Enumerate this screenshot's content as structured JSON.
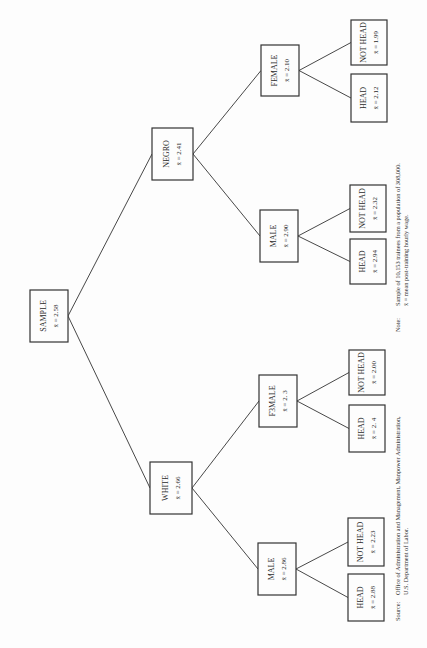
{
  "diagram": {
    "orientation": "rotated-90-ccw",
    "root": {
      "id": "sample",
      "label": "SAMPLE",
      "value": "x̄ = 2.58"
    },
    "nodes": [
      {
        "id": "sample",
        "label": "SAMPLE",
        "value": "x̄ = 2.58",
        "x": 30,
        "y": 290,
        "w": 38,
        "h": 52
      },
      {
        "id": "negro",
        "label": "NEGRO",
        "value": "x̄ = 2.41",
        "x": 152,
        "y": 128,
        "w": 41,
        "h": 52
      },
      {
        "id": "white",
        "label": "WHITE",
        "value": "x̄ = 2.66",
        "x": 150,
        "y": 462,
        "w": 42,
        "h": 52
      },
      {
        "id": "negro-female",
        "label": "FEMALE",
        "value": "x̄ = 2.10",
        "x": 261,
        "y": 45,
        "w": 38,
        "h": 51
      },
      {
        "id": "negro-male",
        "label": "MALE",
        "value": "x̄ = 2.90",
        "x": 260,
        "y": 210,
        "w": 38,
        "h": 52
      },
      {
        "id": "white-female",
        "label": "F3MALE",
        "value": "x̄ = 2. 3",
        "x": 259,
        "y": 375,
        "w": 38,
        "h": 52
      },
      {
        "id": "white-male",
        "label": "MALE",
        "value": "x̄ = 2.86",
        "x": 258,
        "y": 543,
        "w": 38,
        "h": 52
      },
      {
        "id": "nf-nothead",
        "label": "NOT HEAD",
        "value": "x̄ = 1.99",
        "x": 351,
        "y": 20,
        "w": 36,
        "h": 45
      },
      {
        "id": "nf-head",
        "label": "HEAD",
        "value": "x̄ = 2.12",
        "x": 351,
        "y": 74,
        "w": 36,
        "h": 48
      },
      {
        "id": "nm-nothead",
        "label": "NOT HEAD",
        "value": "x̄ = 2.32",
        "x": 350,
        "y": 185,
        "w": 36,
        "h": 47
      },
      {
        "id": "nm-head",
        "label": "HEAD",
        "value": "x̄ = 2.94",
        "x": 350,
        "y": 239,
        "w": 36,
        "h": 45
      },
      {
        "id": "wf-nothead",
        "label": "NOT HEAD",
        "value": "x̄ = 2.00",
        "x": 349,
        "y": 350,
        "w": 36,
        "h": 45
      },
      {
        "id": "wf-head",
        "label": "HEAD",
        "value": "x̄ = 2. 4",
        "x": 349,
        "y": 405,
        "w": 36,
        "h": 47
      },
      {
        "id": "wm-nothead",
        "label": "NOT HEAD",
        "value": "x̄ = 2.23",
        "x": 348,
        "y": 518,
        "w": 36,
        "h": 48
      },
      {
        "id": "wm-head",
        "label": "HEAD",
        "value": "x̄ = 2.88",
        "x": 348,
        "y": 574,
        "w": 36,
        "h": 47
      }
    ],
    "edges": [
      [
        "sample",
        "negro"
      ],
      [
        "sample",
        "white"
      ],
      [
        "negro",
        "negro-female"
      ],
      [
        "negro",
        "negro-male"
      ],
      [
        "white",
        "white-female"
      ],
      [
        "white",
        "white-male"
      ],
      [
        "negro-female",
        "nf-nothead"
      ],
      [
        "negro-female",
        "nf-head"
      ],
      [
        "negro-male",
        "nm-nothead"
      ],
      [
        "negro-male",
        "nm-head"
      ],
      [
        "white-female",
        "wf-nothead"
      ],
      [
        "white-female",
        "wf-head"
      ],
      [
        "white-male",
        "wm-nothead"
      ],
      [
        "white-male",
        "wm-head"
      ]
    ]
  },
  "note": {
    "label": "Note:",
    "line1": "Sample of 10,153 trainees from a population of 308,000.",
    "line2": "x̄ = mean post-training hourly wage."
  },
  "source": {
    "label": "Source:",
    "line1": "Office of Administration and Management, Manpower Administration,",
    "line2": "U.S. Department of Labor."
  }
}
